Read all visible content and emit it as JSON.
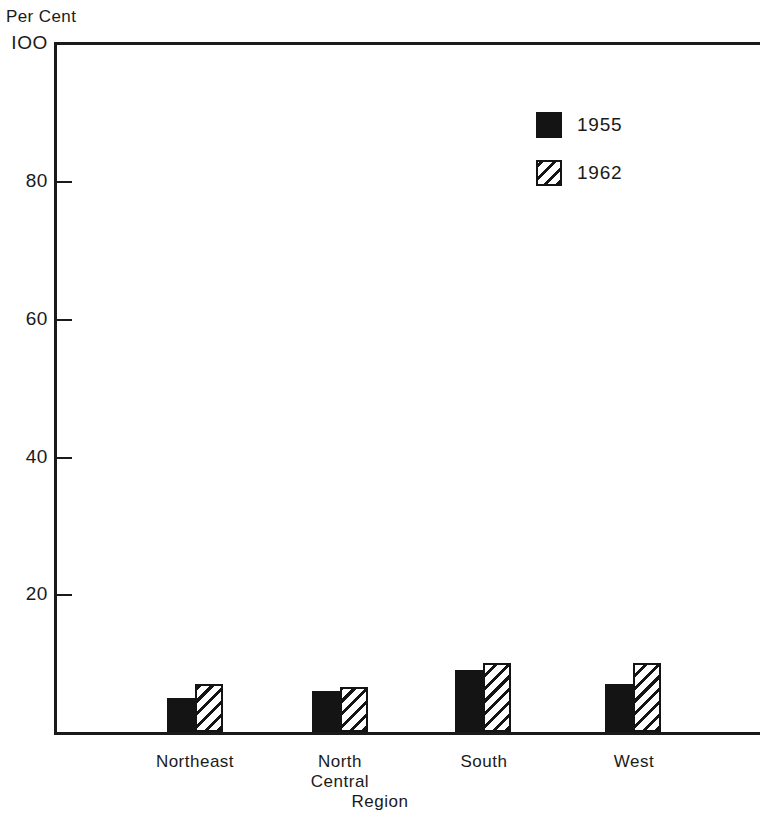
{
  "chart_data": {
    "type": "bar",
    "title": "",
    "subtitle": "",
    "xlabel": "Region",
    "ylabel": "Per Cent",
    "categories": [
      "Northeast",
      "North Central",
      "South",
      "West"
    ],
    "category_label_lines": [
      [
        "Northeast"
      ],
      [
        "North",
        "Central"
      ],
      [
        "South"
      ],
      [
        "West"
      ]
    ],
    "series": [
      {
        "name": "1955",
        "values": [
          5,
          6,
          9,
          7
        ],
        "fill": "solid",
        "color": "#141414"
      },
      {
        "name": "1962",
        "values": [
          7,
          6.5,
          10,
          10
        ],
        "fill": "diagonal-hatch",
        "color": "#141414"
      }
    ],
    "ylim": [
      0,
      100
    ],
    "yticks": [
      20,
      40,
      60,
      80,
      100
    ],
    "ytick_labels": [
      "20",
      "40",
      "60",
      "80",
      "IOO"
    ],
    "grid": false,
    "legend_position": "top-right",
    "legend_entries": [
      "1955",
      "1962"
    ]
  },
  "axes": {
    "y_title": "Per Cent",
    "x_title": "Region"
  }
}
